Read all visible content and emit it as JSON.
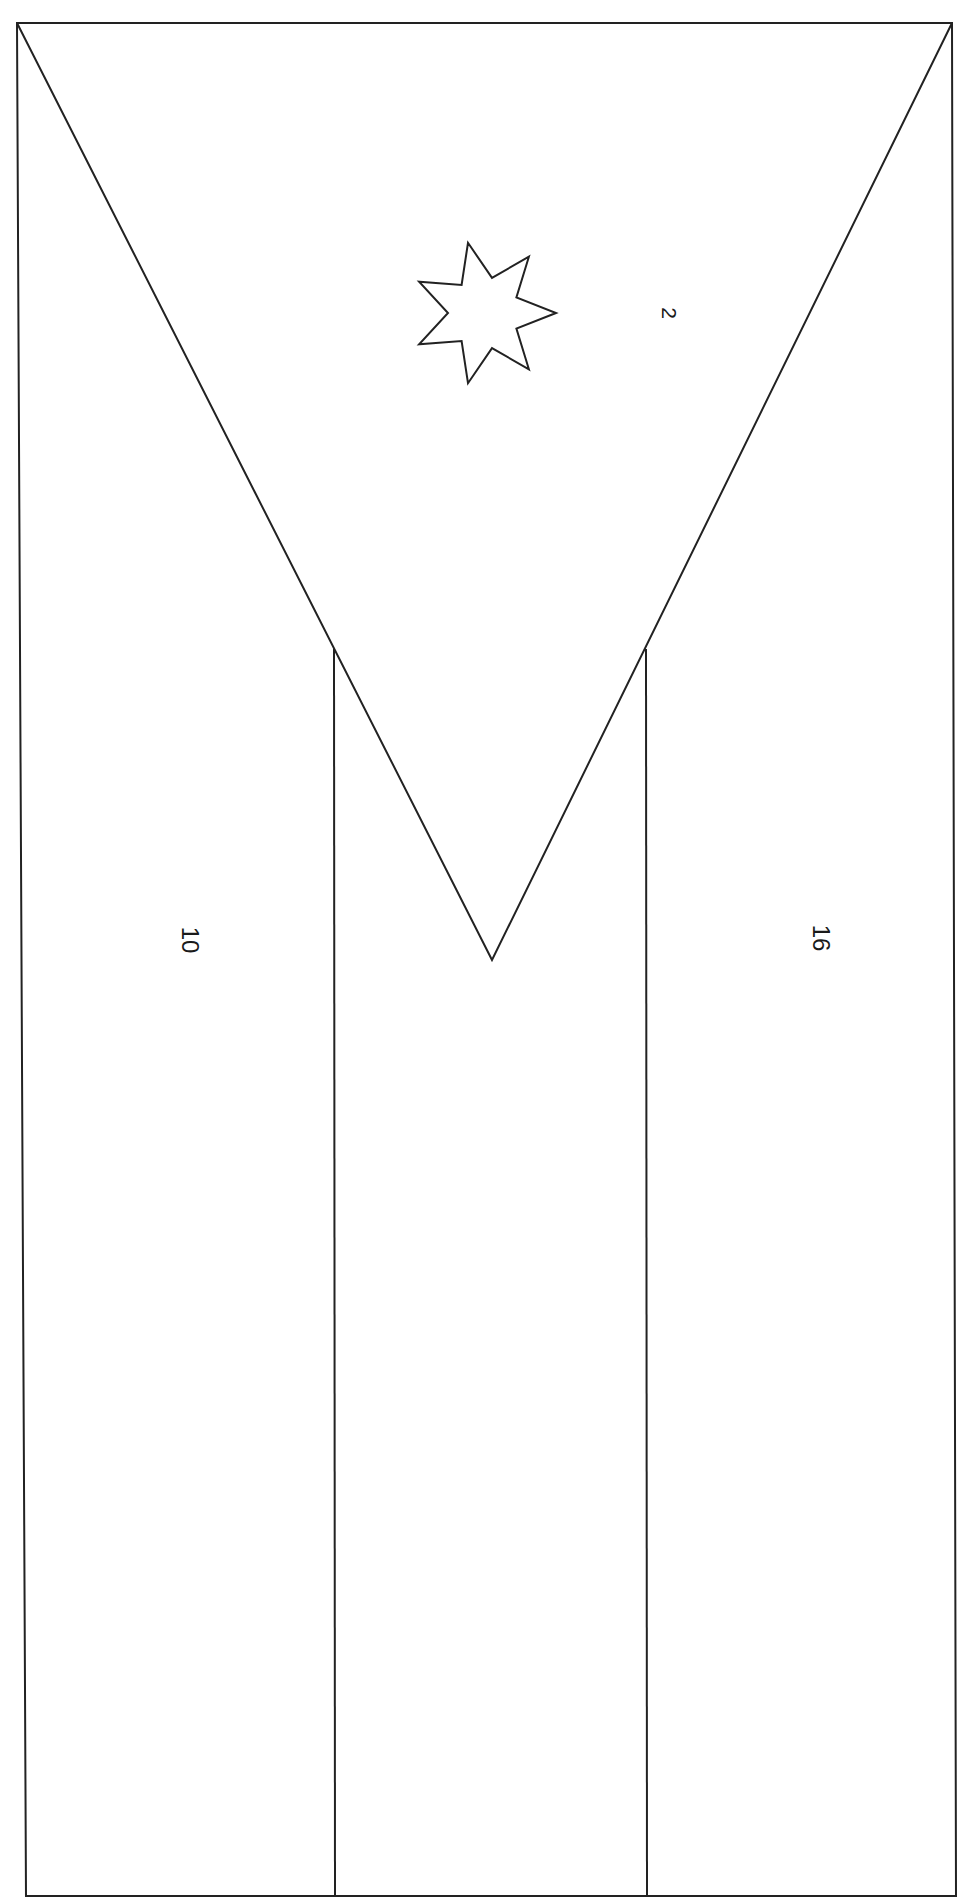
{
  "page": {
    "orientation": "rotated 90deg clockwise",
    "line_color": "#222222",
    "background": "#ffffff"
  },
  "flag": {
    "frame": {
      "top_left": [
        17,
        23
      ],
      "top_right": [
        952,
        23
      ],
      "bottom_right": [
        956,
        1896
      ],
      "bottom_left": [
        26,
        1896
      ]
    },
    "stripes": {
      "divider_left_x": 334,
      "divider_right_x": 646,
      "divider_top_y": 649
    },
    "triangle": {
      "apex": [
        492,
        960
      ]
    },
    "star": {
      "points": 7,
      "center": [
        484,
        313
      ],
      "outer_radius": 72,
      "inner_radius": 36,
      "rotation_deg": 0
    },
    "regions": [
      {
        "id": "triangle",
        "label": "2",
        "x": 669,
        "y": 313
      },
      {
        "id": "stripe-left",
        "label": "10",
        "x": 190,
        "y": 940
      },
      {
        "id": "stripe-right",
        "label": "16",
        "x": 821,
        "y": 938
      }
    ]
  }
}
